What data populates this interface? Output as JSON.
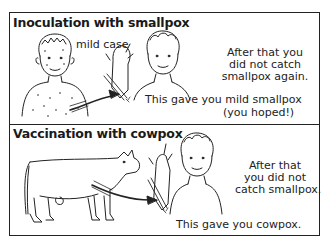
{
  "panels": [
    {
      "title": "Inoculation with smallpox",
      "labels": {
        "mild_case": "mild case",
        "result_line1": "After that you",
        "result_line2": "did not catch",
        "result_line3": "smallpox again.",
        "effect_line1": "This gave you mild smallpox",
        "effect_line2": "(you hoped!)"
      },
      "figures": [
        "sick-person-with-pox-spots",
        "scratching-instrument",
        "healthy-person"
      ]
    },
    {
      "title": "Vaccination with cowpox",
      "labels": {
        "result_line1": "After that",
        "result_line2": "you did not",
        "result_line3": "catch smallpox.",
        "effect_line1": "This gave you cowpox."
      },
      "figures": [
        "cow",
        "scratching-instrument",
        "healthy-person"
      ]
    }
  ]
}
